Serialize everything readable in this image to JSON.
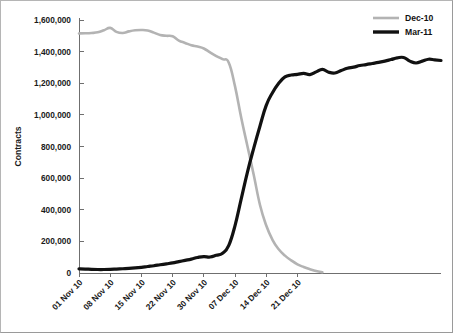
{
  "chart_data": {
    "type": "line",
    "title": "",
    "xlabel": "",
    "ylabel": "Contracts",
    "ylim": [
      0,
      1600000
    ],
    "grid": false,
    "legend_position": "top-right",
    "y_ticks": [
      0,
      200000,
      400000,
      600000,
      800000,
      1000000,
      1200000,
      1400000,
      1600000
    ],
    "y_tick_labels": [
      "0",
      "200,000",
      "400,000",
      "600,000",
      "800,000",
      "1,000,000",
      "1,200,000",
      "1,400,000",
      "1,600,000"
    ],
    "x_tick_labels": [
      "01 Nov 10",
      "08 Nov 10",
      "15 Nov 10",
      "22 Nov 10",
      "30 Nov 10",
      "07 Dec 10",
      "14 Dec 10",
      "21 Dec 10"
    ],
    "x_tick_indices": [
      0,
      5,
      10,
      15,
      20,
      25,
      30,
      35
    ],
    "x_index_count": 39,
    "series": [
      {
        "name": "Dec-10",
        "color": "#b3b3b3",
        "width": 2.6,
        "values": [
          1515000,
          1516000,
          1518000,
          1522000,
          1535000,
          1550000,
          1525000,
          1518000,
          1528000,
          1535000,
          1537000,
          1534000,
          1520000,
          1505000,
          1500000,
          1497000,
          1470000,
          1455000,
          1440000,
          1432000,
          1420000,
          1395000,
          1372000,
          1352000,
          1330000,
          1180000,
          980000,
          800000,
          620000,
          430000,
          300000,
          210000,
          150000,
          110000,
          80000,
          55000,
          38000,
          24000,
          12000,
          5000
        ]
      },
      {
        "name": "Mar-11",
        "color": "#111111",
        "width": 3.2,
        "values": [
          26000,
          25000,
          23000,
          22000,
          22000,
          23000,
          25000,
          27000,
          29000,
          32000,
          36000,
          41000,
          46000,
          52000,
          58000,
          64000,
          72000,
          80000,
          88000,
          98000,
          104000,
          101000,
          112000,
          125000,
          175000,
          300000,
          470000,
          640000,
          790000,
          930000,
          1060000,
          1140000,
          1200000,
          1240000,
          1252000,
          1254000,
          1253000,
          1256000,
          1262000,
          1258000
        ]
      }
    ],
    "series_extended": {
      "Mar-11_tail": [
        1252000,
        1256000,
        1262000,
        1255000,
        1272000,
        1288000,
        1270000,
        1265000,
        1280000,
        1295000,
        1302000,
        1312000,
        1318000,
        1325000,
        1332000,
        1340000,
        1350000,
        1360000,
        1363000,
        1340000,
        1328000,
        1340000,
        1352000,
        1348000,
        1344000
      ]
    }
  },
  "legend": {
    "items": [
      {
        "label": "Dec-10",
        "color": "#b3b3b3"
      },
      {
        "label": "Mar-11",
        "color": "#111111"
      }
    ]
  },
  "axes": {
    "y_title": "Contracts"
  }
}
